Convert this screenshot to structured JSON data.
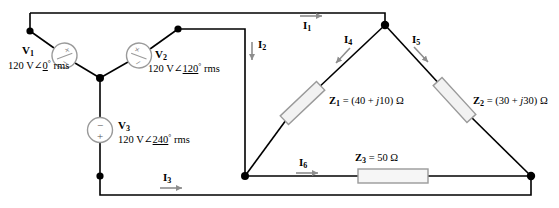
{
  "figure": {
    "colors": {
      "wire": "#000000",
      "node": "#000000",
      "component_outline": "#808080",
      "component_fill": "#ffffff",
      "arrow": "#808080",
      "background": "#ffffff"
    }
  },
  "sources": [
    {
      "name": "V",
      "subscript": "1",
      "magnitude": "120 V",
      "angle": "0",
      "degree": "°",
      "unit": "rms",
      "value_text": "120 V∠0° rms",
      "symbol": "ac-voltage-source"
    },
    {
      "name": "V",
      "subscript": "2",
      "magnitude": "120 V",
      "angle": "120",
      "degree": "°",
      "unit": "rms",
      "value_text": "120 V∠120° rms",
      "symbol": "ac-voltage-source"
    },
    {
      "name": "V",
      "subscript": "3",
      "magnitude": "120 V",
      "angle": "240",
      "degree": "°",
      "unit": "rms",
      "value_text": "120 V∠240° rms",
      "symbol": "dc-voltage-source",
      "plus": "+",
      "minus": "−"
    }
  ],
  "impedances": [
    {
      "name": "Z",
      "subscript": "1",
      "equals": "=",
      "expr": "(40 + j10) Ω",
      "real": 40,
      "imag": 10,
      "unit": "Ω",
      "full_text": "Z1 = (40 + j10) Ω"
    },
    {
      "name": "Z",
      "subscript": "2",
      "equals": "=",
      "expr": "(30 + j30) Ω",
      "real": 30,
      "imag": 30,
      "unit": "Ω",
      "full_text": "Z2 = (30 + j30) Ω"
    },
    {
      "name": "Z",
      "subscript": "3",
      "equals": "=",
      "expr": "50 Ω",
      "real": 50,
      "imag": 0,
      "unit": "Ω",
      "full_text": "Z3 = 50 Ω"
    }
  ],
  "currents": [
    {
      "name": "I",
      "subscript": "1",
      "direction": "right"
    },
    {
      "name": "I",
      "subscript": "2",
      "direction": "down"
    },
    {
      "name": "I",
      "subscript": "3",
      "direction": "right"
    },
    {
      "name": "I",
      "subscript": "4",
      "direction": "down-left"
    },
    {
      "name": "I",
      "subscript": "5",
      "direction": "down-right"
    },
    {
      "name": "I",
      "subscript": "6",
      "direction": "right"
    }
  ]
}
